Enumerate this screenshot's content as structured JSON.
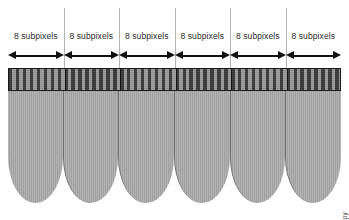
{
  "figure": {
    "segment_count": 6,
    "subpixels_per_segment": 8,
    "attribution": "© Allscopy",
    "colors": {
      "background": "#ffffff",
      "column_fill": "#a9a9a9",
      "column_outline": "#6f6f6f",
      "stripe_dark": "#3a3a3a",
      "stripe_light": "#9a9a9a",
      "strip_border": "#1a1a1a",
      "divider": "#b4b4b4",
      "arrow": "#111111",
      "label_text": "#2a2a2a"
    }
  },
  "segments": [
    {
      "label": "8 subpixels"
    },
    {
      "label": "8 subpixels"
    },
    {
      "label": "8 subpixels"
    },
    {
      "label": "8 subpixels"
    },
    {
      "label": "8 subpixels"
    },
    {
      "label": "8 subpixels"
    }
  ]
}
